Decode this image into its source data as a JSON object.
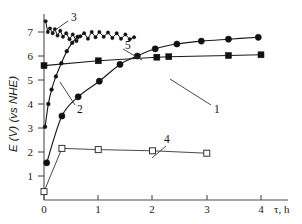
{
  "chart_data": {
    "type": "line",
    "title": "",
    "xlabel": "τ, h",
    "ylabel": "E (V) (vs NHE)",
    "xlim": [
      0,
      4.35
    ],
    "ylim": [
      0,
      7.6
    ],
    "xticks": [
      0,
      1,
      2,
      3,
      4
    ],
    "xticklabels": [
      "0",
      "1",
      "2",
      "3",
      "4"
    ],
    "yticks": [
      1,
      2,
      3,
      4,
      5,
      6,
      7
    ],
    "yticklabels": [
      "1",
      "2",
      "3",
      "4",
      "5",
      "6",
      "7"
    ],
    "grid": false,
    "legend_position": "inline-annotations",
    "series": [
      {
        "name": "1",
        "label": "1",
        "marker": "filled-circle",
        "marker_size": 3.1,
        "x": [
          0.05,
          0.33,
          0.63,
          1.02,
          1.4,
          1.72,
          2.05,
          2.45,
          2.9,
          3.4,
          3.95
        ],
        "y": [
          1.55,
          3.5,
          4.3,
          4.95,
          5.65,
          6.0,
          6.3,
          6.5,
          6.62,
          6.7,
          6.78
        ]
      },
      {
        "name": "2",
        "label": "2",
        "marker": "small-filled",
        "marker_size": 1.9,
        "x": [
          0.02,
          0.08,
          0.14,
          0.22,
          0.32,
          0.42,
          0.52,
          0.62
        ],
        "y": [
          3.05,
          4.0,
          4.6,
          5.15,
          5.7,
          6.2,
          6.55,
          6.8
        ]
      },
      {
        "name": "3",
        "label": "3",
        "marker": "small-filled",
        "marker_size": 1.7,
        "x": [
          0.03,
          0.07,
          0.11,
          0.16,
          0.2,
          0.25,
          0.3,
          0.35,
          0.41,
          0.47,
          0.53,
          0.6,
          0.67,
          0.74,
          0.81,
          0.88,
          0.95,
          1.02,
          1.1,
          1.18,
          1.26,
          1.34,
          1.42,
          1.5,
          1.58,
          1.66
        ],
        "y": [
          7.45,
          7.0,
          7.15,
          6.95,
          7.12,
          6.85,
          7.05,
          6.8,
          6.95,
          6.7,
          6.9,
          6.62,
          6.82,
          6.95,
          6.72,
          7.0,
          6.78,
          7.0,
          6.8,
          6.98,
          6.75,
          6.95,
          6.72,
          6.9,
          6.7,
          6.78
        ]
      },
      {
        "name": "4",
        "label": "4",
        "marker": "open-square",
        "marker_size": 3.0,
        "x": [
          0.0,
          0.33,
          1.0,
          2.0,
          3.0
        ],
        "y": [
          0.35,
          2.15,
          2.1,
          2.05,
          1.95
        ]
      },
      {
        "name": "5",
        "label": "5",
        "marker": "filled-square",
        "marker_size": 3.0,
        "x": [
          0.0,
          1.0,
          2.08,
          2.3,
          3.4,
          4.0
        ],
        "y": [
          5.6,
          5.8,
          5.95,
          5.97,
          6.02,
          6.05
        ]
      }
    ],
    "annotations": [
      {
        "label": "1",
        "x": 215,
        "y": 108
      },
      {
        "label": "2",
        "x": 77,
        "y": 109
      },
      {
        "label": "3",
        "x": 71,
        "y": 17
      },
      {
        "label": "4",
        "x": 167,
        "y": 141
      },
      {
        "label": "5",
        "x": 125,
        "y": 45
      }
    ]
  }
}
